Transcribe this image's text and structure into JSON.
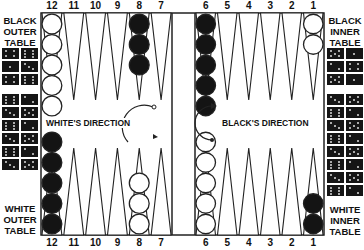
{
  "board": {
    "top_points": [
      "12",
      "11",
      "10",
      "9",
      "8",
      "7",
      "6",
      "5",
      "4",
      "3",
      "2",
      "1"
    ],
    "bottom_points": [
      "12",
      "11",
      "10",
      "9",
      "8",
      "7",
      "6",
      "5",
      "4",
      "3",
      "2",
      "1"
    ],
    "top_checkers": [
      {
        "point": "12",
        "color": "white",
        "count": 5
      },
      {
        "point": "8",
        "color": "black",
        "count": 3
      },
      {
        "point": "6",
        "color": "black",
        "count": 5
      },
      {
        "point": "1",
        "color": "white",
        "count": 2
      }
    ],
    "bottom_checkers": [
      {
        "point": "12",
        "color": "black",
        "count": 5
      },
      {
        "point": "8",
        "color": "white",
        "count": 3
      },
      {
        "point": "6",
        "color": "white",
        "count": 5
      },
      {
        "point": "1",
        "color": "black",
        "count": 2
      }
    ],
    "colors": {
      "black": "#141414",
      "white": "#ffffff",
      "line": "#222222"
    }
  },
  "labels": {
    "black_outer": [
      "BLACK",
      "OUTER",
      "TABLE"
    ],
    "white_outer": [
      "WHITE",
      "OUTER",
      "TABLE"
    ],
    "black_inner": [
      "BLACK",
      "INNER",
      "TABLE"
    ],
    "white_inner": [
      "WHITE",
      "INNER",
      "TABLE"
    ],
    "whites_direction": "WHITE'S DIRECTION",
    "blacks_direction": "BLACK'S DIRECTION"
  },
  "dice_stacks": {
    "left_top_rows": 3,
    "left_bottom_rows": 6,
    "right_top_rows": 3,
    "right_bottom_rows": 8
  }
}
